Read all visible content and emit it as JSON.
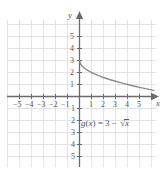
{
  "chart_data": {
    "type": "line",
    "title": "",
    "function_label": "g(x) = 3 - √x",
    "equation_parts": {
      "name": "g",
      "arg": "x",
      "equals": ") = 3 − ",
      "radicand": "x"
    },
    "xlabel": "x",
    "ylabel": "y",
    "xlim": [
      -6.0,
      6.5
    ],
    "ylim": [
      -5.5,
      6.0
    ],
    "grid": true,
    "legend": "none",
    "x_ticks": [
      -5,
      -4,
      -3,
      -2,
      -1,
      1,
      2,
      3,
      4,
      5
    ],
    "x_tick_labels": [
      "−5",
      "−4",
      "−3",
      "−2",
      "−1",
      "1",
      "2",
      "3",
      "4",
      "5"
    ],
    "y_ticks": [
      5,
      4,
      3,
      2,
      1,
      -1,
      -2,
      -3,
      -4,
      -5
    ],
    "y_tick_labels": [
      "5",
      "4",
      "3",
      "2",
      "1",
      "1",
      "2",
      "3",
      "4",
      "5"
    ],
    "domain": [
      0,
      6.2
    ],
    "points": [
      {
        "x": 0.0,
        "y": 3.0
      },
      {
        "x": 0.1,
        "y": 2.684
      },
      {
        "x": 0.2,
        "y": 2.553
      },
      {
        "x": 0.35,
        "y": 2.408
      },
      {
        "x": 0.5,
        "y": 2.293
      },
      {
        "x": 0.75,
        "y": 2.134
      },
      {
        "x": 1.0,
        "y": 2.0
      },
      {
        "x": 1.25,
        "y": 1.882
      },
      {
        "x": 1.5,
        "y": 1.775
      },
      {
        "x": 1.75,
        "y": 1.677
      },
      {
        "x": 2.0,
        "y": 1.586
      },
      {
        "x": 2.5,
        "y": 1.419
      },
      {
        "x": 3.0,
        "y": 1.268
      },
      {
        "x": 3.5,
        "y": 1.129
      },
      {
        "x": 4.0,
        "y": 1.0
      },
      {
        "x": 4.5,
        "y": 0.879
      },
      {
        "x": 5.0,
        "y": 0.764
      },
      {
        "x": 5.5,
        "y": 0.655
      },
      {
        "x": 6.0,
        "y": 0.551
      },
      {
        "x": 6.2,
        "y": 0.51
      }
    ]
  },
  "colors": {
    "grid": "#e3e3e6",
    "axis": "#6b6b6e",
    "curve": "#8c8c90",
    "text": "#58585a",
    "background": "#ffffff"
  },
  "axes": {
    "x_axis_name": "x",
    "y_axis_name": "y"
  }
}
